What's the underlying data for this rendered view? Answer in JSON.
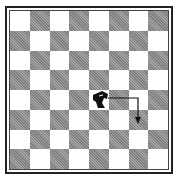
{
  "board": {
    "size": 8,
    "top_left_color": "light",
    "colors": {
      "light": "#ffffff",
      "dark": "#8f8f8f",
      "border": "#222222"
    }
  },
  "pieces": [
    {
      "type": "knight",
      "color": "black",
      "row": 4,
      "col": 4,
      "square": "e4",
      "icon": "knight-icon"
    }
  ],
  "move_arrow": {
    "from": {
      "row": 4,
      "col": 4,
      "square": "e4"
    },
    "to": {
      "row": 5,
      "col": 6,
      "square": "g3"
    },
    "path": "right-then-down",
    "color": "#111111"
  }
}
